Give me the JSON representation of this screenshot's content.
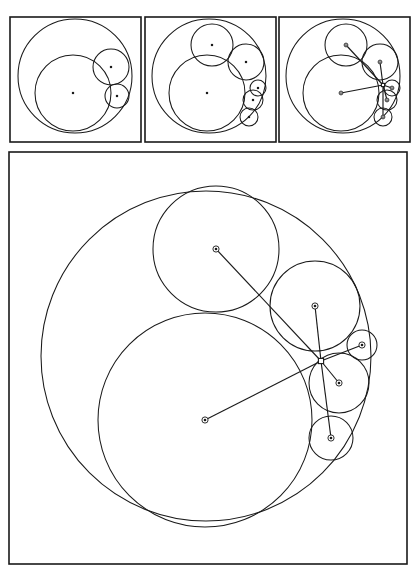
{
  "figure": {
    "background_color": "#ffffff",
    "ink_color": "#1a1a1a",
    "width": 415,
    "height": 571,
    "panel_count": 4
  },
  "chart_data": {
    "type": "diagram",
    "xlabel": "",
    "ylabel": "",
    "panels": [
      {
        "name": "panel-top-left",
        "label": "stage-1",
        "frame": {
          "x": 10,
          "y": 17,
          "width": 131,
          "height": 125
        },
        "circles": [
          {
            "name": "outer-boundary",
            "cx": 75,
            "cy": 76,
            "r": 57,
            "marker": "none"
          },
          {
            "name": "large-inner",
            "cx": 73,
            "cy": 93,
            "r": 38,
            "marker": "dot"
          },
          {
            "name": "medium-upper-right",
            "cx": 111,
            "cy": 67,
            "r": 18,
            "marker": "dot"
          },
          {
            "name": "small-lower-right",
            "cx": 117,
            "cy": 96,
            "r": 12,
            "marker": "dot"
          }
        ],
        "spokes": []
      },
      {
        "name": "panel-top-middle",
        "label": "stage-2",
        "frame": {
          "x": 145,
          "y": 17,
          "width": 131,
          "height": 125
        },
        "circles": [
          {
            "name": "outer-boundary",
            "cx": 209,
            "cy": 76,
            "r": 57,
            "marker": "none"
          },
          {
            "name": "large-inner",
            "cx": 207,
            "cy": 93,
            "r": 38,
            "marker": "dot"
          },
          {
            "name": "top-circle",
            "cx": 212,
            "cy": 45,
            "r": 21,
            "marker": "dot"
          },
          {
            "name": "medium-upper-right",
            "cx": 246,
            "cy": 62,
            "r": 18,
            "marker": "dot"
          },
          {
            "name": "small-right-upper",
            "cx": 258,
            "cy": 88,
            "r": 8,
            "marker": "dot"
          },
          {
            "name": "small-right-mid",
            "cx": 253,
            "cy": 100,
            "r": 10,
            "marker": "dot"
          },
          {
            "name": "small-right-lower",
            "cx": 249,
            "cy": 117,
            "r": 9,
            "marker": "dot"
          }
        ],
        "spokes": []
      },
      {
        "name": "panel-top-right",
        "label": "stage-3",
        "frame": {
          "x": 279,
          "y": 17,
          "width": 131,
          "height": 125
        },
        "circles": [
          {
            "name": "outer-boundary",
            "cx": 343,
            "cy": 76,
            "r": 57,
            "marker": "none"
          },
          {
            "name": "large-inner",
            "cx": 341,
            "cy": 93,
            "r": 38,
            "marker": "dot"
          },
          {
            "name": "top-circle",
            "cx": 346,
            "cy": 45,
            "r": 21,
            "marker": "dot"
          },
          {
            "name": "medium-upper-right",
            "cx": 380,
            "cy": 62,
            "r": 18,
            "marker": "dot"
          },
          {
            "name": "small-right-upper",
            "cx": 392,
            "cy": 88,
            "r": 8,
            "marker": "dot"
          },
          {
            "name": "small-right-mid",
            "cx": 387,
            "cy": 100,
            "r": 10,
            "marker": "dot"
          },
          {
            "name": "small-right-lower",
            "cx": 383,
            "cy": 117,
            "r": 9,
            "marker": "dot"
          }
        ],
        "hub": {
          "x": 383,
          "y": 85
        },
        "spokes": [
          {
            "from_hub": true,
            "to": [
              346,
              45
            ]
          },
          {
            "from_hub": true,
            "to": [
              341,
              93
            ]
          },
          {
            "from_hub": true,
            "to": [
              380,
              62
            ]
          },
          {
            "from_hub": true,
            "to": [
              392,
              88
            ]
          },
          {
            "from_hub": true,
            "to": [
              387,
              100
            ]
          },
          {
            "from_hub": true,
            "to": [
              383,
              117
            ]
          }
        ]
      },
      {
        "name": "panel-main",
        "label": "stage-3-enlarged",
        "frame": {
          "x": 9,
          "y": 152,
          "width": 398,
          "height": 412
        },
        "circles": [
          {
            "name": "outer-boundary",
            "cx": 206,
            "cy": 356,
            "r": 165,
            "marker": "none"
          },
          {
            "name": "large-inner",
            "cx": 205,
            "cy": 420,
            "r": 107,
            "marker": "dot"
          },
          {
            "name": "top-circle",
            "cx": 216,
            "cy": 249,
            "r": 63,
            "marker": "dot"
          },
          {
            "name": "medium-upper-right",
            "cx": 315,
            "cy": 306,
            "r": 45,
            "marker": "dot"
          },
          {
            "name": "small-right-upper",
            "cx": 362,
            "cy": 345,
            "r": 15,
            "marker": "dot"
          },
          {
            "name": "small-right-mid",
            "cx": 339,
            "cy": 383,
            "r": 30,
            "marker": "dot"
          },
          {
            "name": "small-right-lower",
            "cx": 331,
            "cy": 438,
            "r": 22,
            "marker": "dot"
          }
        ],
        "hub": {
          "x": 321,
          "y": 361
        },
        "spokes": [
          {
            "from_hub": true,
            "to": [
              216,
              249
            ],
            "name": "spoke-to-top-circle"
          },
          {
            "from_hub": true,
            "to": [
              205,
              420
            ],
            "name": "spoke-to-large-inner"
          },
          {
            "from_hub": true,
            "to": [
              315,
              306
            ],
            "name": "spoke-to-medium-upper-right"
          },
          {
            "from_hub": true,
            "to": [
              362,
              345
            ],
            "name": "spoke-to-small-right-upper"
          },
          {
            "from_hub": true,
            "to": [
              339,
              383
            ],
            "name": "spoke-to-small-right-mid"
          },
          {
            "from_hub": true,
            "to": [
              331,
              438
            ],
            "name": "spoke-to-small-right-lower"
          }
        ]
      }
    ]
  }
}
